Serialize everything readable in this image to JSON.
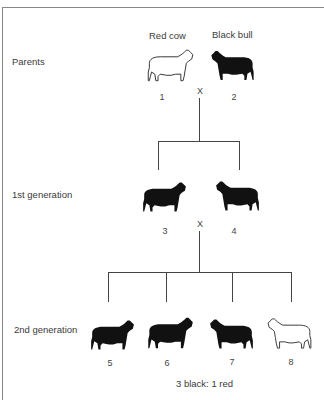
{
  "diagram": {
    "header_labels": {
      "red_cow": "Red cow",
      "black_bull": "Black bull"
    },
    "rows": [
      {
        "label": "Parents",
        "animals": [
          {
            "id": "1",
            "color": "red",
            "fill": "outline"
          },
          {
            "id": "2",
            "color": "black",
            "fill": "solid"
          }
        ],
        "cross": "X"
      },
      {
        "label": "1st generation",
        "animals": [
          {
            "id": "3",
            "color": "black",
            "fill": "solid"
          },
          {
            "id": "4",
            "color": "black",
            "fill": "solid"
          }
        ],
        "cross": "X"
      },
      {
        "label": "2nd generation",
        "animals": [
          {
            "id": "5",
            "color": "black",
            "fill": "solid"
          },
          {
            "id": "6",
            "color": "black",
            "fill": "solid"
          },
          {
            "id": "7",
            "color": "black",
            "fill": "solid"
          },
          {
            "id": "8",
            "color": "red",
            "fill": "outline"
          }
        ]
      }
    ],
    "ratio": "3 black: 1 red",
    "colors": {
      "line": "#444444",
      "silhouette": "#111111",
      "frame": "#888888"
    }
  }
}
